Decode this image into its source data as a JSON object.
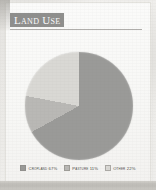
{
  "panel": {
    "title": "Land Use"
  },
  "chart_data": {
    "type": "pie",
    "title": "Land Use",
    "categories": [
      "Cropland",
      "Pasture",
      "Other"
    ],
    "values": [
      67,
      11,
      22
    ],
    "value_unit": "%",
    "start_angle_deg": 0,
    "direction": "clockwise",
    "legend_position": "bottom",
    "grid": false,
    "slices": [
      {
        "label": "Cropland",
        "value": 67,
        "legend_text": "Cropland 67%",
        "color": "#9a9a98"
      },
      {
        "label": "Pasture",
        "value": 11,
        "legend_text": "Pasture 11%",
        "color": "#b9b8b5"
      },
      {
        "label": "Other",
        "value": 22,
        "legend_text": "Other 22%",
        "color": "#d9d8d4"
      }
    ]
  },
  "colors": {
    "banner": "#8f8f8d",
    "banner_text": "#fdfdfd",
    "cropland": "#9a9a98",
    "pasture": "#b9b8b5",
    "other": "#d9d8d4",
    "paper": "#f5f4f2",
    "bottom_band": "#c5c3be"
  }
}
